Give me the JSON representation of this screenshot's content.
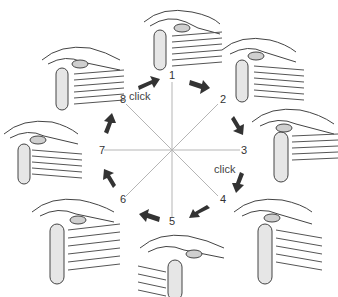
{
  "diagram": {
    "positions": [
      {
        "id": "1",
        "label": "1",
        "x": 172,
        "y": 76
      },
      {
        "id": "2",
        "label": "2",
        "x": 223,
        "y": 100
      },
      {
        "id": "3",
        "label": "3",
        "x": 244,
        "y": 150
      },
      {
        "id": "4",
        "label": "4",
        "x": 223,
        "y": 200
      },
      {
        "id": "5",
        "label": "5",
        "x": 172,
        "y": 222
      },
      {
        "id": "6",
        "label": "6",
        "x": 121,
        "y": 200
      },
      {
        "id": "7",
        "label": "7",
        "x": 100,
        "y": 150
      },
      {
        "id": "8",
        "label": "8",
        "x": 121,
        "y": 100
      }
    ],
    "annotations": [
      {
        "text": "click",
        "x": 131,
        "y": 98,
        "between": "8-1"
      },
      {
        "text": "click",
        "x": 215,
        "y": 165,
        "between": "3-4"
      }
    ],
    "center": {
      "x": 172,
      "y": 150
    },
    "colors": {
      "lines": "#b0b0b0",
      "arrows": "#333333",
      "ink": "#444444"
    }
  }
}
